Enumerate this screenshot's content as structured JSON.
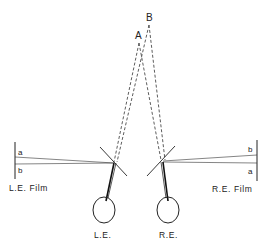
{
  "diagram": {
    "type": "stereoscope-optics",
    "points": {
      "A": {
        "label": "A"
      },
      "B": {
        "label": "B"
      }
    },
    "left": {
      "film_label": "L.E. Film",
      "film_marks": [
        "a",
        "b"
      ],
      "eye_label": "L.E."
    },
    "right": {
      "film_label": "R.E. Film",
      "film_marks": [
        "b",
        "a"
      ],
      "eye_label": "R.E."
    },
    "colors": {
      "line": "#222222",
      "background": "#ffffff"
    }
  }
}
